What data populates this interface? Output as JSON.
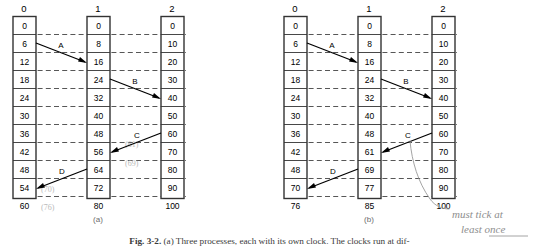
{
  "figure": {
    "caption_prefix": "Fig. 3-2.",
    "caption_text": "(a) Three processes, each with its own clock.  The clocks run at dif-",
    "subcaption_a": "(a)",
    "subcaption_b": "(b)"
  },
  "colors": {
    "box_border": "#333333",
    "grid_dash": "#444444",
    "arrow": "#000000",
    "pencil": "#b9b9b9",
    "handwriting": "#9a9a9a"
  },
  "diagram_a": {
    "process_headers": [
      "0",
      "1",
      "2"
    ],
    "columns": [
      {
        "header": "0",
        "values": [
          "0",
          "6",
          "12",
          "18",
          "24",
          "30",
          "36",
          "42",
          "48",
          "54",
          "60"
        ]
      },
      {
        "header": "1",
        "values": [
          "0",
          "8",
          "16",
          "24",
          "32",
          "40",
          "48",
          "56",
          "64",
          "72",
          "80"
        ]
      },
      {
        "header": "2",
        "values": [
          "0",
          "10",
          "20",
          "30",
          "40",
          "50",
          "60",
          "70",
          "80",
          "90",
          "100"
        ]
      }
    ],
    "messages": [
      {
        "label": "A",
        "from_col": 0,
        "from_row": 1,
        "to_col": 1,
        "to_row": 2,
        "send_value": "6",
        "recv_value": "16"
      },
      {
        "label": "B",
        "from_col": 1,
        "from_row": 3,
        "to_col": 2,
        "to_row": 4,
        "send_value": "24",
        "recv_value": "40"
      },
      {
        "label": "C",
        "from_col": 2,
        "from_row": 6,
        "to_col": 1,
        "to_row": 7,
        "send_value": "60",
        "recv_value": "56"
      },
      {
        "label": "D",
        "from_col": 1,
        "from_row": 8,
        "to_col": 0,
        "to_row": 9,
        "send_value": "64",
        "recv_value": "54"
      }
    ],
    "pencil_marks": [
      "(61)",
      "(69)",
      "(70)",
      "(76)"
    ]
  },
  "diagram_b": {
    "process_headers": [
      "0",
      "1",
      "2"
    ],
    "columns": [
      {
        "header": "0",
        "values": [
          "0",
          "6",
          "12",
          "18",
          "24",
          "30",
          "36",
          "42",
          "48",
          "70",
          "76"
        ]
      },
      {
        "header": "1",
        "values": [
          "0",
          "8",
          "16",
          "24",
          "32",
          "40",
          "48",
          "61",
          "69",
          "77",
          "85"
        ]
      },
      {
        "header": "2",
        "values": [
          "0",
          "10",
          "20",
          "30",
          "40",
          "50",
          "60",
          "70",
          "80",
          "90",
          "100"
        ]
      }
    ],
    "messages": [
      {
        "label": "A",
        "from_col": 0,
        "from_row": 1,
        "to_col": 1,
        "to_row": 2,
        "send_value": "6",
        "recv_value": "16"
      },
      {
        "label": "B",
        "from_col": 1,
        "from_row": 3,
        "to_col": 2,
        "to_row": 4,
        "send_value": "24",
        "recv_value": "40"
      },
      {
        "label": "C",
        "from_col": 2,
        "from_row": 6,
        "to_col": 1,
        "to_row": 7,
        "send_value": "60",
        "recv_value": "61"
      },
      {
        "label": "D",
        "from_col": 1,
        "from_row": 8,
        "to_col": 0,
        "to_row": 9,
        "send_value": "69",
        "recv_value": "70"
      }
    ]
  },
  "annotation": {
    "line1": "must tick at",
    "line2": "least once"
  }
}
